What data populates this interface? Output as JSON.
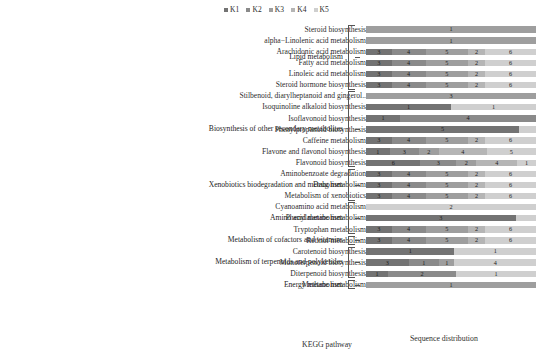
{
  "legend": {
    "items": [
      {
        "label": "K1",
        "color": "#737373"
      },
      {
        "label": "K2",
        "color": "#8a8a8a"
      },
      {
        "label": "K3",
        "color": "#9e9e9e"
      },
      {
        "label": "K4",
        "color": "#b5b5b5"
      },
      {
        "label": "K5",
        "color": "#cfcfcf"
      }
    ]
  },
  "captions": {
    "kegg": "KEGG pathway",
    "sequence": "Sequence distribution"
  },
  "groups": [
    {
      "label": "Lipid metabolism",
      "start": 0,
      "count": 6
    },
    {
      "label": "Biosynthesis of other secondary metabolites",
      "start": 6,
      "count": 7
    },
    {
      "label": "Xenobiotics biodegradation and metabolism",
      "start": 13,
      "count": 3
    },
    {
      "label": "Amino acid metabolism",
      "start": 16,
      "count": 3
    },
    {
      "label": "Metabolism of cofactors and vitamins",
      "start": 19,
      "count": 1
    },
    {
      "label": "Metabolism of terpenoids and polyketides",
      "start": 20,
      "count": 3
    },
    {
      "label": "Energy metabolism",
      "start": 23,
      "count": 1
    }
  ],
  "chart_data": {
    "type": "bar",
    "title": "",
    "xlabel": "Sequence distribution",
    "ylabel": "KEGG pathway",
    "orientation": "horizontal",
    "stacked": true,
    "normalized": true,
    "grid": false,
    "legend_position": "top",
    "series": [
      "K1",
      "K2",
      "K3",
      "K4",
      "K5"
    ],
    "colors": [
      "#737373",
      "#8a8a8a",
      "#9e9e9e",
      "#b5b5b5",
      "#cfcfcf"
    ],
    "categories": [
      "Steroid biosynthesis",
      "alpha−Linolenic acid metabolism",
      "Arachidonic acid metabolism",
      "Fatty acid metabolism",
      "Linoleic acid metabolism",
      "Steroid hormone biosynthesis",
      "Stilbenoid, diarylheptanoid and gingerol..",
      "Isoquinoline alkaloid biosynthesis",
      "Isoflavonoid biosynthesis",
      "Phenylpropanoid biosynthesis",
      "Caffeine metabolism",
      "Flavone and flavonol biosynthesis",
      "Flavonoid biosynthesis",
      "Aminobenzoate degradation",
      "Drug metabolism",
      "Metabolism of xenobiotics",
      "Cyanoamino acid metabolism",
      "Phenylalanine metabolism",
      "Tryptophan metabolism",
      "Retinol metabolism",
      "Carotenoid biosynthesis",
      "Monoterpenoid biosynthesis",
      "Diterpenoid biosynthesis",
      "Methane metabolism"
    ],
    "rows": [
      {
        "category": "Steroid biosynthesis",
        "values": [
          0,
          0,
          1,
          0,
          0
        ],
        "labels": [
          "",
          "",
          "1",
          "",
          ""
        ],
        "widths": [
          0,
          0,
          100,
          0,
          0
        ]
      },
      {
        "category": "alpha−Linolenic acid metabolism",
        "values": [
          0,
          0,
          1,
          0,
          0
        ],
        "labels": [
          "",
          "",
          "1",
          "",
          ""
        ],
        "widths": [
          0,
          0,
          100,
          0,
          0
        ]
      },
      {
        "category": "Arachidonic acid metabolism",
        "values": [
          3,
          4,
          5,
          2,
          6
        ],
        "labels": [
          "3",
          "4",
          "5",
          "2",
          "6"
        ],
        "widths": [
          15,
          20,
          25,
          10,
          30
        ]
      },
      {
        "category": "Fatty acid metabolism",
        "values": [
          3,
          4,
          5,
          2,
          6
        ],
        "labels": [
          "3",
          "4",
          "5",
          "2",
          "6"
        ],
        "widths": [
          15,
          20,
          25,
          10,
          30
        ]
      },
      {
        "category": "Linoleic acid metabolism",
        "values": [
          3,
          4,
          5,
          2,
          6
        ],
        "labels": [
          "3",
          "4",
          "5",
          "2",
          "6"
        ],
        "widths": [
          15,
          20,
          25,
          10,
          30
        ]
      },
      {
        "category": "Steroid hormone biosynthesis",
        "values": [
          3,
          4,
          5,
          2,
          6
        ],
        "labels": [
          "3",
          "4",
          "5",
          "2",
          "6"
        ],
        "widths": [
          15,
          20,
          25,
          10,
          30
        ]
      },
      {
        "category": "Stilbenoid, diarylheptanoid and gingerol..",
        "values": [
          0,
          0,
          3,
          0,
          0
        ],
        "labels": [
          "",
          "",
          "3",
          "",
          ""
        ],
        "widths": [
          0,
          0,
          100,
          0,
          0
        ]
      },
      {
        "category": "Isoquinoline alkaloid biosynthesis",
        "values": [
          1,
          0,
          0,
          0,
          1
        ],
        "labels": [
          "1",
          "",
          "",
          "",
          "1"
        ],
        "widths": [
          50,
          0,
          0,
          0,
          50
        ]
      },
      {
        "category": "Isoflavonoid biosynthesis",
        "values": [
          1,
          4,
          0,
          0,
          0
        ],
        "labels": [
          "1",
          "4",
          "",
          "",
          ""
        ],
        "widths": [
          20,
          80,
          0,
          0,
          0
        ]
      },
      {
        "category": "Phenylpropanoid biosynthesis",
        "values": [
          5,
          0,
          0,
          0,
          0
        ],
        "labels": [
          "5",
          "",
          "",
          "",
          ""
        ],
        "widths": [
          90,
          0,
          0,
          0,
          10
        ]
      },
      {
        "category": "Caffeine metabolism",
        "values": [
          3,
          4,
          5,
          2,
          6
        ],
        "labels": [
          "3",
          "4",
          "5",
          "2",
          "6"
        ],
        "widths": [
          15,
          20,
          25,
          10,
          30
        ]
      },
      {
        "category": "Flavone and flavonol biosynthesis",
        "values": [
          1,
          3,
          2,
          4,
          5
        ],
        "labels": [
          "1",
          "3",
          "2",
          "4",
          "5"
        ],
        "widths": [
          14,
          17,
          12,
          28,
          29
        ]
      },
      {
        "category": "Flavonoid biosynthesis",
        "values": [
          6,
          3,
          2,
          4,
          1
        ],
        "labels": [
          "6",
          "3",
          "2",
          "4",
          "1"
        ],
        "widths": [
          32,
          21,
          12,
          24,
          11
        ]
      },
      {
        "category": "Aminobenzoate degradation",
        "values": [
          3,
          4,
          5,
          2,
          6
        ],
        "labels": [
          "3",
          "4",
          "5",
          "2",
          "6"
        ],
        "widths": [
          15,
          20,
          25,
          10,
          30
        ]
      },
      {
        "category": "Drug metabolism",
        "values": [
          3,
          4,
          5,
          2,
          6
        ],
        "labels": [
          "3",
          "4",
          "5",
          "2",
          "6"
        ],
        "widths": [
          15,
          20,
          25,
          10,
          30
        ]
      },
      {
        "category": "Metabolism of xenobiotics",
        "values": [
          3,
          4,
          5,
          2,
          6
        ],
        "labels": [
          "3",
          "4",
          "5",
          "2",
          "6"
        ],
        "widths": [
          15,
          20,
          25,
          10,
          30
        ]
      },
      {
        "category": "Cyanoamino acid metabolism",
        "values": [
          0,
          0,
          0,
          0,
          2
        ],
        "labels": [
          "",
          "",
          "",
          "",
          "2"
        ],
        "widths": [
          0,
          0,
          0,
          0,
          100
        ]
      },
      {
        "category": "Phenylalanine metabolism",
        "values": [
          3,
          0,
          0,
          0,
          0
        ],
        "labels": [
          "3",
          "",
          "",
          "",
          ""
        ],
        "widths": [
          88,
          0,
          0,
          0,
          12
        ]
      },
      {
        "category": "Tryptophan metabolism",
        "values": [
          3,
          4,
          5,
          2,
          6
        ],
        "labels": [
          "3",
          "4",
          "5",
          "2",
          "6"
        ],
        "widths": [
          15,
          20,
          25,
          10,
          30
        ]
      },
      {
        "category": "Retinol metabolism",
        "values": [
          3,
          4,
          5,
          2,
          6
        ],
        "labels": [
          "3",
          "4",
          "5",
          "2",
          "6"
        ],
        "widths": [
          15,
          20,
          25,
          10,
          30
        ]
      },
      {
        "category": "Carotenoid biosynthesis",
        "values": [
          1,
          0,
          0,
          0,
          1
        ],
        "labels": [
          "1",
          "",
          "",
          "",
          "1"
        ],
        "widths": [
          52,
          0,
          0,
          0,
          48
        ]
      },
      {
        "category": "Monoterpenoid biosynthesis",
        "values": [
          3,
          1,
          1,
          0,
          4
        ],
        "labels": [
          "3",
          "1",
          "1",
          "",
          "4"
        ],
        "widths": [
          25,
          18,
          9,
          0,
          48
        ]
      },
      {
        "category": "Diterpenoid biosynthesis",
        "values": [
          1,
          2,
          0,
          0,
          1
        ],
        "labels": [
          "1",
          "2",
          "",
          "",
          "1"
        ],
        "widths": [
          13,
          40,
          0,
          0,
          47
        ]
      },
      {
        "category": "Methane metabolism",
        "values": [
          0,
          0,
          1,
          0,
          0
        ],
        "labels": [
          "",
          "",
          "1",
          "",
          ""
        ],
        "widths": [
          0,
          0,
          100,
          0,
          0
        ]
      }
    ]
  }
}
